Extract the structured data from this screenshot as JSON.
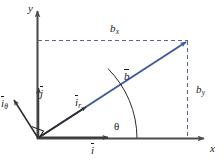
{
  "figure": {
    "background_color": "#ffffff",
    "vector_color": "#3c5a9a",
    "axis_color": "#4d4d4d",
    "text_color": "#1a1a1a",
    "dash_color": "#5a6a8a"
  },
  "axes": {
    "x_label": "x",
    "y_label": "y",
    "origin_label": ""
  },
  "vectors": {
    "b": {
      "label": "b",
      "overbar": true,
      "color": "#3c5a9a"
    },
    "i_r": {
      "label": "i",
      "subscript": "r",
      "overbar": true
    },
    "i_theta": {
      "label": "i",
      "subscript": "θ",
      "overbar": true
    },
    "i_hat": {
      "label": "i",
      "overbar": true
    },
    "j_hat": {
      "label": "j",
      "overbar": true
    }
  },
  "components": {
    "bx": {
      "label": "b",
      "subscript": "x"
    },
    "by": {
      "label": "b",
      "subscript": "y"
    }
  },
  "angle": {
    "label": "θ"
  },
  "markers": {
    "right_angle": "right-angle-square"
  }
}
